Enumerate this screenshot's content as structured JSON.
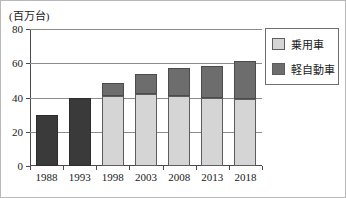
{
  "chart_data": {
    "type": "bar",
    "stacked": true,
    "title": "",
    "subtitle": "",
    "unit_caption": "(百万台)",
    "xlabel": "",
    "ylabel": "",
    "categories": [
      "1988",
      "1993",
      "1998",
      "2003",
      "2008",
      "2013",
      "2018"
    ],
    "series": [
      {
        "name": "乗用車",
        "color": "#d5d5d5",
        "values": [
          0,
          0,
          41,
          42,
          41,
          40,
          39
        ]
      },
      {
        "name": "軽自動車",
        "color": "#6d6d6d",
        "values": [
          29.5,
          39.5,
          7.5,
          12,
          16,
          18.5,
          22.5
        ]
      }
    ],
    "totals": [
      29.5,
      39.5,
      48.5,
      54,
      57,
      58.5,
      61.5
    ],
    "ylim": [
      0,
      80
    ],
    "yticks": [
      0,
      20,
      40,
      60,
      80
    ],
    "ytick_labels": [
      "0",
      "20",
      "40",
      "60",
      "80"
    ],
    "grid": true,
    "grid_axis": "y",
    "legend_position": "right"
  },
  "legend": {
    "items": [
      {
        "label": "乗用車",
        "swatch": "#d5d5d5"
      },
      {
        "label": "軽自動車",
        "swatch": "#6d6d6d"
      }
    ]
  },
  "colors": {
    "passenger": "#d5d5d5",
    "kei": "#6d6d6d",
    "solid_early": "#3a3a3a",
    "axis": "#4a4a4a",
    "grid": "#8c8c8c",
    "border": "#b9b9b9",
    "text": "#1a1a1a"
  }
}
